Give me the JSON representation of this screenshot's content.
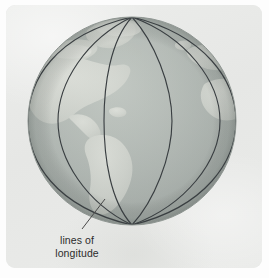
{
  "figure": {
    "kind": "illustration-diagram",
    "card": {
      "background_color": "#e9eae8",
      "border_radius_px": 9,
      "page_background_color": "#fdfdfd"
    }
  },
  "globe": {
    "name": "earth-globe",
    "center_x": 132,
    "center_y": 121,
    "radius": 104,
    "ocean_color": "#a9b0ad",
    "ocean_highlight_color": "#c3c8c4",
    "land_color": "#cfd2cc",
    "land_highlight_color": "#dcdeD8",
    "outline_color": "#8e9591",
    "meridian_color": "#3a3f42",
    "meridian_width_px": 1.2,
    "meridian_count": 6,
    "meridian_equator_x": [
      28,
      57,
      105,
      172,
      220,
      236
    ],
    "pole_top_y": 17,
    "pole_bottom_y": 225,
    "landmasses": [
      "greenland",
      "north-america",
      "central-america",
      "south-america",
      "western-europe",
      "northwest-africa"
    ]
  },
  "annotation": {
    "label_line1": "lines of",
    "label_line2": "longitude",
    "label_text": "lines of\nlongitude",
    "text_color": "#2c2c2c",
    "font_size_px": 10.5,
    "leader_line": {
      "name": "leader-line",
      "color": "#4a4a4a",
      "width_px": 1,
      "from_x": 82,
      "from_y": 229,
      "to_x": 104,
      "to_y": 199
    }
  }
}
